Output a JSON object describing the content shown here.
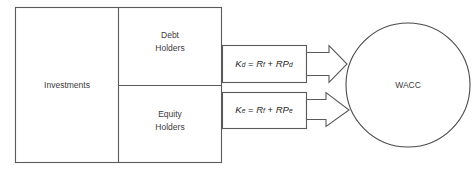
{
  "diagram": {
    "stroke_color": "#5a5a5a",
    "text_color": "#3b3b3b",
    "background": "#ffffff",
    "boxes": {
      "investments": {
        "label": "Investments"
      },
      "debt_holders": {
        "label_line1": "Debt",
        "label_line2": "Holders"
      },
      "equity_holders": {
        "label_line1": "Equity",
        "label_line2": "Holders"
      }
    },
    "formulas": {
      "debt": {
        "lhs_var": "K",
        "lhs_sub": "d",
        "equals": " = ",
        "term1_var": "R",
        "term1_sub": "f",
        "plus": " + ",
        "term2_var": "RP",
        "term2_sub": "d",
        "plain": "Kd = Rf + RPd"
      },
      "equity": {
        "lhs_var": "K",
        "lhs_sub": "e",
        "equals": " = ",
        "term1_var": "R",
        "term1_sub": "f",
        "plus": " + ",
        "term2_var": "RP",
        "term2_sub": "e",
        "plain": "Ke = Rf + RPe"
      }
    },
    "result": {
      "label": "WACC"
    }
  }
}
